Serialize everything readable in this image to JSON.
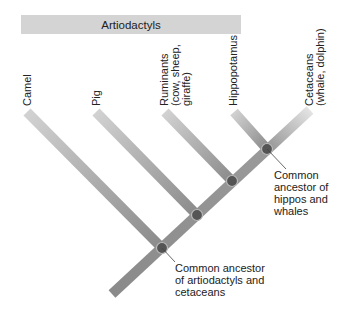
{
  "group": {
    "label": "Artiodactyls"
  },
  "taxa": [
    {
      "id": "camel",
      "lines": [
        "Camel"
      ]
    },
    {
      "id": "pig",
      "lines": [
        "Pig"
      ]
    },
    {
      "id": "ruminants",
      "lines": [
        "Ruminants",
        "(cow, sheep,",
        "giraffe)"
      ]
    },
    {
      "id": "hippopotamus",
      "lines": [
        "Hippopotamus"
      ]
    },
    {
      "id": "cetaceans",
      "lines": [
        "Cetaceans",
        "(whale, dolphin)"
      ]
    }
  ],
  "annotations": {
    "hippo_whale": {
      "lines": [
        "Common",
        "ancestor of",
        "hippos and",
        "whales"
      ]
    },
    "root": {
      "lines": [
        "Common ancestor",
        "of artiodactyls and",
        "cetaceans"
      ]
    }
  },
  "colors": {
    "branch": "#8e8e8e",
    "branch_light": "#cfcfcf",
    "node": "#555555",
    "group_bar": "#d4d4d4"
  }
}
